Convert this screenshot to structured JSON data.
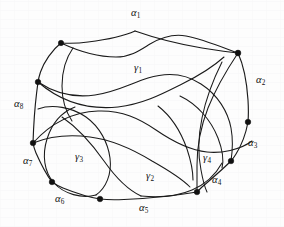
{
  "figure": {
    "kind": "curve-intersection-diagram",
    "width": 284,
    "height": 227,
    "background_color": "#fdfdfd",
    "ink_color": "#1a1a1a"
  },
  "edge_labels": [
    {
      "id": "alpha-1",
      "base": "α",
      "sub": "1",
      "x": 131,
      "y": 8
    },
    {
      "id": "alpha-2",
      "base": "α",
      "sub": "2",
      "x": 256,
      "y": 75
    },
    {
      "id": "alpha-3",
      "base": "α",
      "sub": "3",
      "x": 248,
      "y": 138
    },
    {
      "id": "alpha-4",
      "base": "α",
      "sub": "4",
      "x": 212,
      "y": 175
    },
    {
      "id": "alpha-5",
      "base": "α",
      "sub": "5",
      "x": 139,
      "y": 203
    },
    {
      "id": "alpha-6",
      "base": "α",
      "sub": "6",
      "x": 55,
      "y": 194
    },
    {
      "id": "alpha-7",
      "base": "α",
      "sub": "7",
      "x": 23,
      "y": 156
    },
    {
      "id": "alpha-8",
      "base": "α",
      "sub": "8",
      "x": 14,
      "y": 99
    }
  ],
  "region_labels": [
    {
      "id": "gamma-1",
      "base": "γ",
      "sub": "1",
      "x": 134,
      "y": 63
    },
    {
      "id": "gamma-2",
      "base": "γ",
      "sub": "2",
      "x": 146,
      "y": 171
    },
    {
      "id": "gamma-3",
      "base": "γ",
      "sub": "3",
      "x": 75,
      "y": 152
    },
    {
      "id": "gamma-4",
      "base": "γ",
      "sub": "4",
      "x": 203,
      "y": 153
    }
  ],
  "vertices": [
    {
      "id": "v-alpha1-apex",
      "x": 135,
      "y": 31,
      "r": 0
    },
    {
      "id": "v-top-left",
      "x": 61,
      "y": 43,
      "r": 2.7
    },
    {
      "id": "v-top-right",
      "x": 238,
      "y": 53,
      "r": 2.9
    },
    {
      "id": "v-left-upper",
      "x": 38,
      "y": 82,
      "r": 2.8
    },
    {
      "id": "v-right-upper",
      "x": 248,
      "y": 122,
      "r": 2.8
    },
    {
      "id": "v-left-lower",
      "x": 33,
      "y": 143,
      "r": 2.8
    },
    {
      "id": "v-right-lower",
      "x": 231,
      "y": 161,
      "r": 2.8
    },
    {
      "id": "v-bottom-left",
      "x": 52,
      "y": 182,
      "r": 2.8
    },
    {
      "id": "v-bottom-right",
      "x": 197,
      "y": 192,
      "r": 2.8
    },
    {
      "id": "v-bottom-mid",
      "x": 100,
      "y": 199,
      "r": 2.8
    }
  ],
  "boundary_edges": [
    {
      "id": "edge-alpha-1-left",
      "d": "M 135 31 C 122 37 104 40 88 42 C 78 43.5 68 43.4 61 43"
    },
    {
      "id": "edge-alpha-1-right",
      "d": "M 135 31 C 152 37 178 44 202 48 C 218 50.5 230 52.2 238 53"
    },
    {
      "id": "edge-alpha-2",
      "d": "M 238 53 C 244 66 247 85 248 100 C 248.6 110 248.4 117 248 122"
    },
    {
      "id": "edge-alpha-3",
      "d": "M 248 122 C 246 133 241 146 236 154 C 233.6 157.8 232.3 159.6 231 161"
    },
    {
      "id": "edge-alpha-4",
      "d": "M 231 161 C 222 170 210 180 202 187 C 199.6 189.2 198.3 190.8 197 192"
    },
    {
      "id": "edge-alpha-5",
      "d": "M 197 192 C 176 195.5 148 198.5 124 199.5 C 113 200 105 199.6 100 199"
    },
    {
      "id": "edge-alpha-6",
      "d": "M 100 199 C 87 197 73 192 63 188 C 57.5 185.7 54.3 183.6 52 182"
    },
    {
      "id": "edge-alpha-7",
      "d": "M 52 182 C 46 174 40 162 36 153 C 34.3 149 33.5 145.7 33 143"
    },
    {
      "id": "edge-alpha-8",
      "d": "M 33 143 C 33.5 128 35 106 36.6 93 C 37.3 87.5 37.7 84.2 38 82"
    },
    {
      "id": "edge-top-left-to-left-upper",
      "d": "M 61 43 C 52 50 44 62 40.5 72 C 39 76.5 38.4 79.6 38 82"
    }
  ],
  "interior_curves": [
    {
      "id": "curve-gamma1-inner-top",
      "d": "M 61 43 C 76 50 96 57 116 57 C 131 57 141 49.5 150 44 C 162 37 174 33.6 186 36 C 202 39 219 46 238 53"
    },
    {
      "id": "curve-long-upper-sweep",
      "d": "M 38 82 C 56 94 74 98 95 95 C 116 92 132 83 148 78 C 167 72 186 74 201 84 C 218 95 228 112 231 128 C 233 139 232.5 151 231 161"
    },
    {
      "id": "curve-midband",
      "d": "M 33 143 C 50 124 72 112 98 111 C 122 110 140 119 156 130 C 172 141 188 150 207 152 C 221 153.5 240 150 252 141"
    },
    {
      "id": "curve-gamma3-loop-left",
      "d": "M 38 109 C 52 104 72 107 86 117 C 100 127 108 143 110 158 C 112 174 106 188 96 195"
    },
    {
      "id": "curve-gamma3-loop-right",
      "d": "M 96 195 C 82 199 64 194 54 183 C 44 172 42 155 47 139 C 52 123 62 112 75 107"
    },
    {
      "id": "curve-gamma2-left-wall",
      "d": "M 62 117 C 78 128 92 144 104 161 C 116 178 128 190 141 196"
    },
    {
      "id": "curve-gamma2-arc-bottom",
      "d": "M 141 196 C 160 198 178 196 192 190 C 206 184 216 174 222 163"
    },
    {
      "id": "curve-gamma4-loop",
      "d": "M 180 96 C 197 104 211 120 218 138 C 223 151 224 160 222 168"
    },
    {
      "id": "curve-gamma4-inner",
      "d": "M 158 106 C 171 116 181 132 187 149 C 191 161 193 171 193 180"
    },
    {
      "id": "curve-right-cross-a",
      "d": "M 238 53 C 228 68 216 88 208 108 C 201 126 197 148 197 165 C 197 180 197 188 197 192"
    },
    {
      "id": "curve-right-cross-b",
      "d": "M 222 62 C 214 78 206 98 202 118 C 198 137 198 155 201 170 C 203 181 205 188 207 192"
    },
    {
      "id": "curve-left-sweep-low",
      "d": "M 33 143 C 48 137 68 134 90 137 C 114 140 134 150 152 161 C 168 170 182 179 190 187"
    },
    {
      "id": "curve-inner-upper-small",
      "d": "M 73 48 C 66 58 62 72 62 86 C 62 100 66 112 72 121"
    },
    {
      "id": "curve-gamma1-lower-boundary",
      "d": "M 38 82 C 60 101 88 110 118 107 C 144 104 164 93 182 84 C 199 75.6 214 66 224 57"
    }
  ]
}
